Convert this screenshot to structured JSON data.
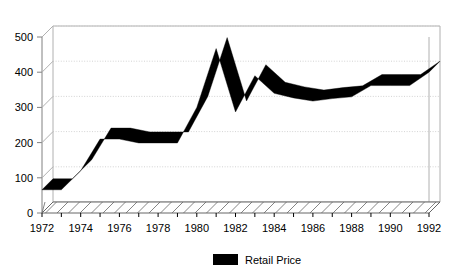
{
  "chart_data": {
    "type": "line",
    "title": "",
    "subtitle": "",
    "xlabel": "",
    "ylabel": "",
    "ylim": [
      0,
      500
    ],
    "xlim": [
      1972,
      1992
    ],
    "grid": true,
    "legend_position": "bottom-center",
    "style": "3d-ribbon-line",
    "yticks": [
      0,
      100,
      200,
      300,
      400,
      500
    ],
    "ytick_labels": [
      "0",
      "100",
      "200",
      "300",
      "400",
      "500"
    ],
    "xticks": [
      1972,
      1974,
      1976,
      1978,
      1980,
      1982,
      1984,
      1986,
      1988,
      1990,
      1992
    ],
    "xtick_labels": [
      "1972",
      "1974",
      "1976",
      "1978",
      "1980",
      "1982",
      "1984",
      "1986",
      "1988",
      "1990",
      "1992"
    ],
    "x": [
      1972,
      1973,
      1974,
      1975,
      1976,
      1977,
      1978,
      1979,
      1980,
      1981,
      1982,
      1983,
      1984,
      1985,
      1986,
      1987,
      1988,
      1989,
      1990,
      1991,
      1992
    ],
    "series": [
      {
        "name": "Retail Price",
        "color": "#000000",
        "values": [
          66,
          66,
          120,
          210,
          210,
          199,
          199,
          199,
          300,
          467,
          287,
          390,
          340,
          327,
          318,
          325,
          330,
          362,
          362,
          362,
          400
        ]
      }
    ],
    "legend": [
      {
        "label": "Retail Price",
        "color": "#000000",
        "marker": "filled-rectangle"
      }
    ]
  },
  "colors": {
    "series": "#000000",
    "grid": "#c8c8c8",
    "axis": "#808080",
    "wall": "#b0b0b0",
    "floor": "#666666",
    "text": "#000000",
    "background": "#ffffff"
  }
}
